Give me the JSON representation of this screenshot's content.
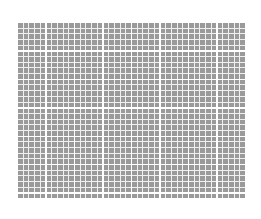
{
  "canvas": {
    "width": 261,
    "height": 219,
    "background_color": "#ffffff"
  },
  "grid": {
    "label": "checkered grid pattern",
    "x": 17,
    "y": 22,
    "width": 228,
    "height": 176,
    "columns": 40,
    "rows": 31,
    "cell_width": 5.7,
    "cell_height": 5.68,
    "cell_color": "#9a9a9a",
    "minor_line_color": "#f0f0f0",
    "minor_line_width": 1,
    "major_line_color": "#ffffff",
    "major_line_width": 1.4,
    "major_every_n_cells": 5
  },
  "chart_data": {
    "type": "heatmap",
    "title": "",
    "subtitle": "",
    "xlabel": "",
    "ylabel": "",
    "grid": true,
    "legend": "none",
    "tick_labels_x": [],
    "tick_labels_y": [],
    "annotations": [],
    "columns": 40,
    "rows": 31,
    "uniform_value_color": "#9a9a9a"
  }
}
